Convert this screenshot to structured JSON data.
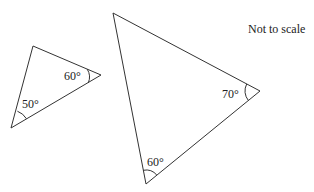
{
  "diagram": {
    "note": "Not to scale",
    "cutoff_text": "",
    "stroke_color": "#333333",
    "triangles": [
      {
        "name": "small-triangle",
        "vertices": [
          [
            33,
            46
          ],
          [
            101,
            75
          ],
          [
            11,
            128
          ]
        ],
        "angles": [
          {
            "vertex": "right",
            "label": "60°"
          },
          {
            "vertex": "bottom-left",
            "label": "50°"
          }
        ]
      },
      {
        "name": "large-triangle",
        "vertices": [
          [
            113,
            13
          ],
          [
            260,
            91
          ],
          [
            146,
            184
          ]
        ],
        "angles": [
          {
            "vertex": "right",
            "label": "70°"
          },
          {
            "vertex": "bottom",
            "label": "60°"
          }
        ]
      }
    ]
  }
}
